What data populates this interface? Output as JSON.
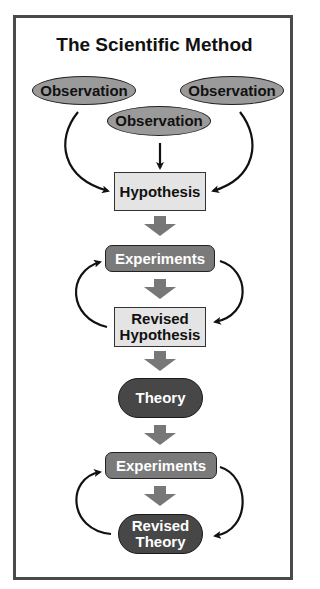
{
  "title": "The Scientific Method",
  "nodes": {
    "observation_left": "Observation",
    "observation_center": "Observation",
    "observation_right": "Observation",
    "hypothesis": "Hypothesis",
    "experiments_1": "Experiments",
    "revised_hypothesis_1": "Revised",
    "revised_hypothesis_2": "Hypothesis",
    "theory": "Theory",
    "experiments_2": "Experiments",
    "revised_theory_1": "Revised",
    "revised_theory_2": "Theory"
  },
  "colors": {
    "frame": "#4a4a4a",
    "observation_fill": "#9a9a9a",
    "hypothesis_fill": "#e4e4e4",
    "experiments_fill": "#7a7a7a",
    "theory_fill": "#474747",
    "block_arrow": "#777777"
  }
}
